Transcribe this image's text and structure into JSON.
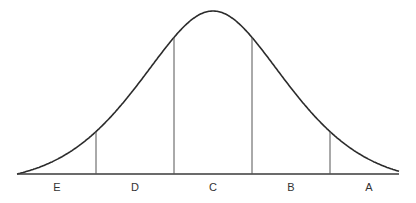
{
  "diagram": {
    "type": "normal-distribution-curve",
    "regions": [
      {
        "label": "E"
      },
      {
        "label": "D"
      },
      {
        "label": "C"
      },
      {
        "label": "B"
      },
      {
        "label": "A"
      }
    ],
    "boundaries_sd": [
      -1.5,
      -0.5,
      0.5,
      1.5
    ],
    "colors": {
      "curve": "#2b2b2b",
      "dividers": "#555555",
      "text": "#333333"
    }
  }
}
